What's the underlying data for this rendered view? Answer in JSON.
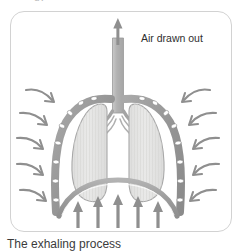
{
  "page": {
    "top_clipped_text": "gy",
    "background_color": "#ffffff"
  },
  "figure": {
    "frame_border_color": "#d2d2d2",
    "caption": "The exhaling process",
    "labels": {
      "air_out": "Air drawn out"
    },
    "icons": {
      "air_out_arrow": "arrow-up-icon",
      "diaphragm_arrow": "arrow-up-icon",
      "rib_pressure_arrow": "curved-arrow-inward-icon"
    },
    "colors": {
      "rib_cage": "#9a9a9a",
      "rib_segment": "#ffffff",
      "lung_fill": "#e6e6e6",
      "lung_outline": "#a8a8a8",
      "trachea": "#b0b0b0",
      "diaphragm": "#a0a0a0",
      "arrow": "#8c8c8c",
      "text": "#2e2e2e"
    },
    "counts": {
      "left_arrows": 5,
      "right_arrows": 5,
      "diaphragm_arrows": 5,
      "rib_segments_per_side": 8
    },
    "anatomy": [
      {
        "name": "trachea",
        "description": "vertical airway from top of figure down to carina"
      },
      {
        "name": "bronchi",
        "description": "branching airways entering each lung"
      },
      {
        "name": "left-lung",
        "description": "rounded lung lobe, viewer left"
      },
      {
        "name": "right-lung",
        "description": "rounded lung lobe, viewer right"
      },
      {
        "name": "rib-cage",
        "description": "segmented arc enclosing the lungs on both sides"
      },
      {
        "name": "diaphragm",
        "description": "dome-shaped muscle beneath the lungs, raised during exhaling"
      }
    ]
  }
}
